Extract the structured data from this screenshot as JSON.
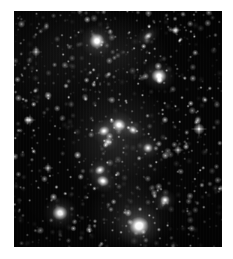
{
  "figure": {
    "domain_description": "astronomical-image",
    "object_type": "galaxy-cluster-field",
    "frame": {
      "x": 14,
      "y": 11,
      "width": 208,
      "height": 236
    },
    "canvas": {
      "width": 233,
      "height": 259
    },
    "background_color": "#ffffff",
    "sky_color": "#050505",
    "star_color": "#ffffff",
    "galaxy_core_color": "#ffffff",
    "galaxy_halo_color": "#b9b9b9"
  },
  "sky": {
    "star_field": {
      "count": 900,
      "seed": 20240517,
      "min_radius_px": 0.35,
      "max_radius_px": 1.5,
      "min_brightness": 0.1,
      "max_brightness": 1.0,
      "note": "dense faint point-source background across whole frame"
    },
    "bright_stars": [
      {
        "name": "field-star-right-edge",
        "x": 199,
        "y": 129,
        "radius": 2.2,
        "brightness": 0.95,
        "spikes": true
      },
      {
        "name": "field-star-upper-left",
        "x": 36,
        "y": 52,
        "radius": 1.7,
        "brightness": 0.8,
        "spikes": true
      },
      {
        "name": "field-star-mid-left",
        "x": 30,
        "y": 120,
        "radius": 1.6,
        "brightness": 0.75,
        "spikes": true
      },
      {
        "name": "field-star-lower-left",
        "x": 48,
        "y": 168,
        "radius": 1.5,
        "brightness": 0.72,
        "spikes": true
      },
      {
        "name": "field-star-top-right",
        "x": 176,
        "y": 30,
        "radius": 1.5,
        "brightness": 0.7,
        "spikes": true
      },
      {
        "name": "field-star-mid-right",
        "x": 178,
        "y": 150,
        "radius": 1.6,
        "brightness": 0.74,
        "spikes": true
      },
      {
        "name": "field-star-lower-right",
        "x": 190,
        "y": 196,
        "radius": 1.4,
        "brightness": 0.66,
        "spikes": false
      },
      {
        "name": "field-star-center",
        "x": 112,
        "y": 100,
        "radius": 1.4,
        "brightness": 0.68,
        "spikes": false
      }
    ],
    "galaxies": [
      {
        "name": "galaxy-north",
        "x": 97,
        "y": 41,
        "core_radius": 4.0,
        "halo_radius": 17,
        "brightness": 0.92,
        "ellipticity": 1.0,
        "angle": 0
      },
      {
        "name": "galaxy-northeast-diffuse",
        "x": 148,
        "y": 36,
        "core_radius": 2.6,
        "halo_radius": 15,
        "brightness": 0.62,
        "ellipticity": 0.62,
        "angle": -38
      },
      {
        "name": "galaxy-northeast-bright",
        "x": 159,
        "y": 76,
        "core_radius": 4.0,
        "halo_radius": 17,
        "brightness": 0.9,
        "ellipticity": 0.92,
        "angle": 10
      },
      {
        "name": "galaxy-core-west",
        "x": 104,
        "y": 131,
        "core_radius": 3.0,
        "halo_radius": 14,
        "brightness": 0.78,
        "ellipticity": 0.85,
        "angle": -20
      },
      {
        "name": "galaxy-core-central",
        "x": 119,
        "y": 125,
        "core_radius": 3.6,
        "halo_radius": 16,
        "brightness": 0.88,
        "ellipticity": 0.9,
        "angle": 15
      },
      {
        "name": "galaxy-core-east",
        "x": 133,
        "y": 130,
        "core_radius": 2.6,
        "halo_radius": 12,
        "brightness": 0.7,
        "ellipticity": 0.8,
        "angle": 30
      },
      {
        "name": "galaxy-core-southwest",
        "x": 108,
        "y": 142,
        "core_radius": 2.4,
        "halo_radius": 11,
        "brightness": 0.66,
        "ellipticity": 0.88,
        "angle": 0
      },
      {
        "name": "galaxy-mid-east",
        "x": 148,
        "y": 148,
        "core_radius": 2.6,
        "halo_radius": 12,
        "brightness": 0.72,
        "ellipticity": 0.95,
        "angle": 0
      },
      {
        "name": "galaxy-south-chain-upper",
        "x": 100,
        "y": 170,
        "core_radius": 2.8,
        "halo_radius": 13,
        "brightness": 0.74,
        "ellipticity": 0.8,
        "angle": -25
      },
      {
        "name": "galaxy-south-chain-lower",
        "x": 103,
        "y": 181,
        "core_radius": 3.2,
        "halo_radius": 14,
        "brightness": 0.82,
        "ellipticity": 0.85,
        "angle": 20
      },
      {
        "name": "galaxy-southeast-small",
        "x": 165,
        "y": 200,
        "core_radius": 2.6,
        "halo_radius": 12,
        "brightness": 0.74,
        "ellipticity": 0.95,
        "angle": 0
      },
      {
        "name": "galaxy-southwest-bright",
        "x": 60,
        "y": 213,
        "core_radius": 4.0,
        "halo_radius": 18,
        "brightness": 0.9,
        "ellipticity": 0.95,
        "angle": 0
      },
      {
        "name": "galaxy-south-brightest",
        "x": 139,
        "y": 226,
        "core_radius": 5.2,
        "halo_radius": 24,
        "brightness": 1.0,
        "ellipticity": 0.95,
        "angle": 0
      }
    ],
    "intracluster_light": [
      {
        "name": "icl-core-halo",
        "x": 118,
        "y": 140,
        "radius_x": 56,
        "radius_y": 62,
        "opacity": 0.13
      },
      {
        "name": "icl-south-halo",
        "x": 132,
        "y": 215,
        "radius_x": 44,
        "radius_y": 38,
        "opacity": 0.1
      },
      {
        "name": "icl-north-halo",
        "x": 120,
        "y": 55,
        "radius_x": 50,
        "radius_y": 40,
        "opacity": 0.07
      }
    ]
  }
}
